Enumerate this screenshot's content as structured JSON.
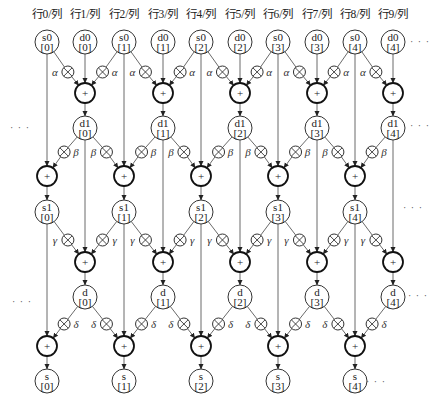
{
  "diagram": {
    "width": 438,
    "height": 410,
    "column_x": [
      47,
      85,
      124,
      163,
      201,
      240,
      278,
      317,
      355,
      393
    ],
    "column_headers": [
      "行0/列",
      "行1/列",
      "行2/列",
      "行3/列",
      "行4/列",
      "行5/列",
      "行6/列",
      "行7/列",
      "行8/列",
      "行9/列"
    ],
    "header_y": 14,
    "stages": [
      {
        "name": "input",
        "y": 42,
        "nodes": [
          {
            "col": 0,
            "line1": "s0",
            "line2": "[0]"
          },
          {
            "col": 1,
            "line1": "d0",
            "line2": "[0]"
          },
          {
            "col": 2,
            "line1": "s0",
            "line2": "[1]"
          },
          {
            "col": 3,
            "line1": "d0",
            "line2": "[1]"
          },
          {
            "col": 4,
            "line1": "s0",
            "line2": "[2]"
          },
          {
            "col": 5,
            "line1": "d0",
            "line2": "[2]"
          },
          {
            "col": 6,
            "line1": "s0",
            "line2": "[3]"
          },
          {
            "col": 7,
            "line1": "d0",
            "line2": "[3]"
          },
          {
            "col": 8,
            "line1": "s0",
            "line2": "[4]"
          },
          {
            "col": 9,
            "line1": "d0",
            "line2": "[4]"
          }
        ]
      }
    ],
    "lifting_steps": [
      {
        "coef": "α",
        "mult_y": 72,
        "adder_y": 93,
        "out_y": 128,
        "out_prefix": "d1",
        "targets": [
          1,
          3,
          5,
          7,
          9
        ],
        "sources_prev_stage": "s0",
        "through_cols": [
          0,
          2,
          4,
          6,
          8
        ]
      },
      {
        "coef": "β",
        "mult_y": 152,
        "adder_y": 176,
        "out_y": 212,
        "out_prefix": "s1",
        "targets": [
          0,
          2,
          4,
          6,
          8
        ],
        "through_cols": [
          1,
          3,
          5,
          7,
          9
        ]
      },
      {
        "coef": "γ",
        "mult_y": 240,
        "adder_y": 262,
        "out_y": 297,
        "out_prefix": "d",
        "targets": [
          1,
          3,
          5,
          7,
          9
        ],
        "through_cols": [
          0,
          2,
          4,
          6,
          8
        ]
      },
      {
        "coef": "δ",
        "mult_y": 324,
        "adder_y": 346,
        "out_y": 381,
        "out_prefix": "s",
        "targets": [
          0,
          2,
          4,
          6,
          8
        ],
        "through_cols": [
          1,
          3,
          5,
          7,
          9
        ]
      }
    ],
    "symbols": {
      "adder": "+",
      "multiplier": "⊗"
    },
    "ellipses": [
      {
        "x": 20,
        "y": 128,
        "text": "· · ·"
      },
      {
        "x": 22,
        "y": 302,
        "text": "· · ·"
      },
      {
        "x": 420,
        "y": 42,
        "text": "· · ·"
      },
      {
        "x": 420,
        "y": 126,
        "text": "· · ·"
      },
      {
        "x": 413,
        "y": 208,
        "text": "· · ·"
      },
      {
        "x": 418,
        "y": 296,
        "text": "· · ·"
      },
      {
        "x": 376,
        "y": 382,
        "text": "· · ·"
      }
    ]
  }
}
